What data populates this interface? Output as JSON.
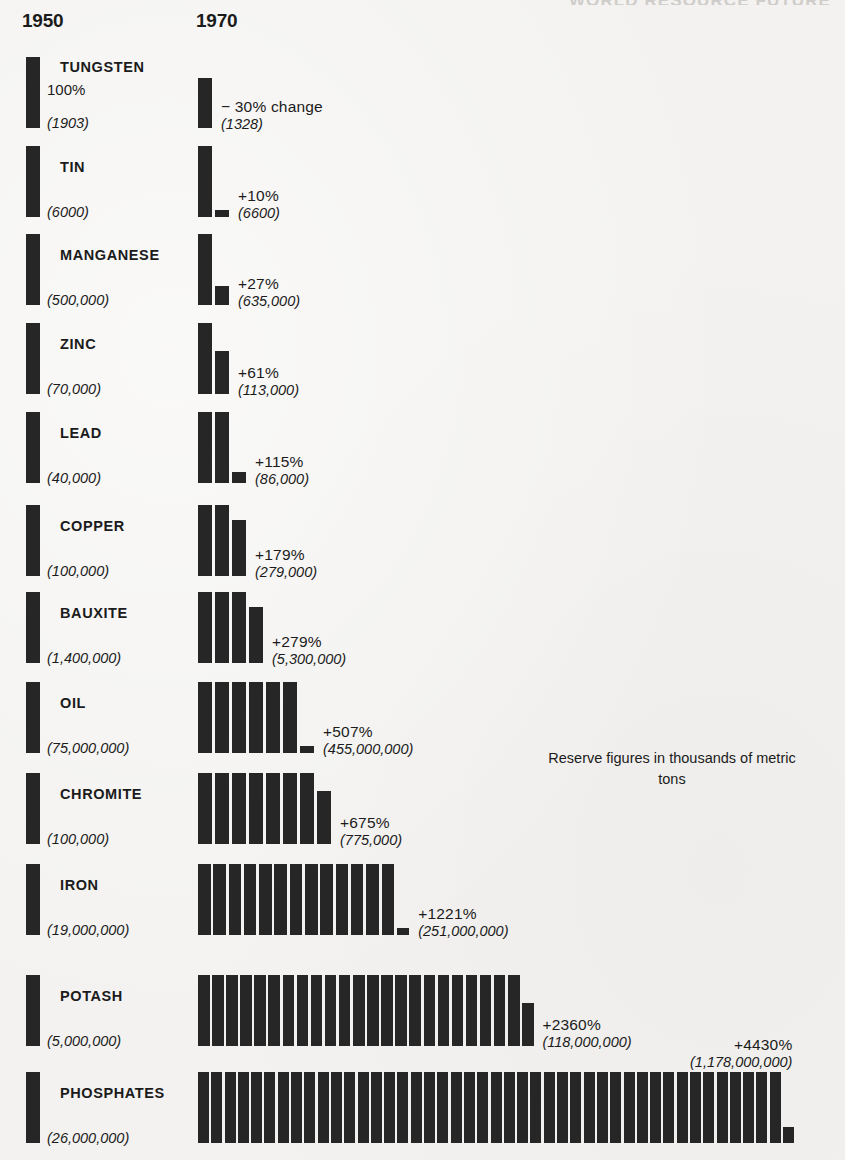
{
  "running_head": "WORLD RESOURCE FUTURE",
  "headers": {
    "col_1950": "1950",
    "col_1970": "1970"
  },
  "note": "Reserve figures in thousands of metric tons",
  "baseline_label": "100%",
  "first_row_change_suffix": "change",
  "chart_data": {
    "type": "bar",
    "title": "",
    "subtitle": "",
    "xlabel": "",
    "ylabel": "",
    "grid": false,
    "legend_position": "none",
    "note": "Reserve figures in thousands of metric tons",
    "categories": [
      "TUNGSTEN",
      "TIN",
      "MANGANESE",
      "ZINC",
      "LEAD",
      "COPPER",
      "BAUXITE",
      "OIL",
      "CHROMITE",
      "IRON",
      "POTASH",
      "PHOSPHATES"
    ],
    "series": [
      {
        "name": "1950 reserve",
        "values": [
          1903,
          6000,
          500000,
          70000,
          40000,
          100000,
          1400000,
          75000000,
          100000,
          19000000,
          5000000,
          26000000
        ]
      },
      {
        "name": "1970 reserve",
        "values": [
          1328,
          6600,
          635000,
          113000,
          86000,
          279000,
          5300000,
          455000000,
          775000,
          251000000,
          118000000,
          1178000000
        ]
      },
      {
        "name": "percent change",
        "values": [
          -30,
          10,
          27,
          61,
          115,
          179,
          279,
          507,
          675,
          1221,
          2360,
          4430
        ]
      }
    ],
    "rows": [
      {
        "mineral": "TUNGSTEN",
        "pct_1950": "100%",
        "reserve_1950": "(1903)",
        "pct_change": "− 30% change",
        "reserve_1970": "(1328)",
        "ratio": 0.7,
        "full_bars": 0,
        "partial": 0.7
      },
      {
        "mineral": "TIN",
        "pct_1950": "",
        "reserve_1950": "(6000)",
        "pct_change": "+10%",
        "reserve_1970": "(6600)",
        "ratio": 1.1,
        "full_bars": 1,
        "partial": 0.1
      },
      {
        "mineral": "MANGANESE",
        "pct_1950": "",
        "reserve_1950": "(500,000)",
        "pct_change": "+27%",
        "reserve_1970": "(635,000)",
        "ratio": 1.27,
        "full_bars": 1,
        "partial": 0.27
      },
      {
        "mineral": "ZINC",
        "pct_1950": "",
        "reserve_1950": "(70,000)",
        "pct_change": "+61%",
        "reserve_1970": "(113,000)",
        "ratio": 1.61,
        "full_bars": 1,
        "partial": 0.61
      },
      {
        "mineral": "LEAD",
        "pct_1950": "",
        "reserve_1950": "(40,000)",
        "pct_change": "+115%",
        "reserve_1970": "(86,000)",
        "ratio": 2.15,
        "full_bars": 2,
        "partial": 0.15
      },
      {
        "mineral": "COPPER",
        "pct_1950": "",
        "reserve_1950": "(100,000)",
        "pct_change": "+179%",
        "reserve_1970": "(279,000)",
        "ratio": 2.79,
        "full_bars": 2,
        "partial": 0.79
      },
      {
        "mineral": "BAUXITE",
        "pct_1950": "",
        "reserve_1950": "(1,400,000)",
        "pct_change": "+279%",
        "reserve_1970": "(5,300,000)",
        "ratio": 3.79,
        "full_bars": 3,
        "partial": 0.79
      },
      {
        "mineral": "OIL",
        "pct_1950": "",
        "reserve_1950": "(75,000,000)",
        "pct_change": "+507%",
        "reserve_1970": "(455,000,000)",
        "ratio": 6.07,
        "full_bars": 6,
        "partial": 0.07
      },
      {
        "mineral": "CHROMITE",
        "pct_1950": "",
        "reserve_1950": "(100,000)",
        "pct_change": "+675%",
        "reserve_1970": "(775,000)",
        "ratio": 7.75,
        "full_bars": 7,
        "partial": 0.75
      },
      {
        "mineral": "IRON",
        "pct_1950": "",
        "reserve_1950": "(19,000,000)",
        "pct_change": "+1221%",
        "reserve_1970": "(251,000,000)",
        "ratio": 13.21,
        "full_bars": 13,
        "partial": 0.1
      },
      {
        "mineral": "POTASH",
        "pct_1950": "",
        "reserve_1950": "(5,000,000)",
        "pct_change": "+2360%",
        "reserve_1970": "(118,000,000)",
        "ratio": 23.6,
        "full_bars": 23,
        "partial": 0.6
      },
      {
        "mineral": "PHOSPHATES",
        "pct_1950": "",
        "reserve_1950": "(26,000,000)",
        "pct_change": "+4430%",
        "reserve_1970": "(1,178,000,000)",
        "ratio": 45.3,
        "full_bars": 44,
        "partial": 0.22
      }
    ]
  }
}
